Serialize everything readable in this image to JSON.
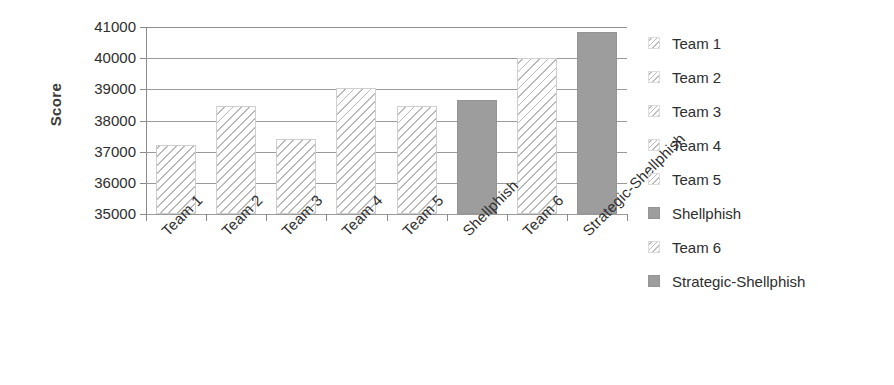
{
  "chart_data": {
    "type": "bar",
    "title": "",
    "xlabel": "",
    "ylabel": "Score",
    "ylim": [
      35000,
      41000
    ],
    "ytick_step": 1000,
    "yticks": [
      41000,
      40000,
      39000,
      38000,
      37000,
      36000,
      35000
    ],
    "ytick_labels": [
      "41000",
      "40000",
      "39000",
      "38000",
      "37000",
      "36000",
      "35000"
    ],
    "grid": true,
    "legend_position": "right",
    "categories": [
      "Team 1",
      "Team 2",
      "Team 3",
      "Team 4",
      "Team 5",
      "Shellphish",
      "Team 6",
      "Strategic-Shellphish"
    ],
    "values": [
      37200,
      38450,
      37400,
      39050,
      38450,
      38650,
      40000,
      40850
    ],
    "bars": [
      {
        "label": "Team 1",
        "value": 37200,
        "style": "hatch"
      },
      {
        "label": "Team 2",
        "value": 38450,
        "style": "hatch"
      },
      {
        "label": "Team 3",
        "value": 37400,
        "style": "hatch"
      },
      {
        "label": "Team 4",
        "value": 39050,
        "style": "hatch"
      },
      {
        "label": "Team 5",
        "value": 38450,
        "style": "hatch"
      },
      {
        "label": "Shellphish",
        "value": 38650,
        "style": "solid"
      },
      {
        "label": "Team 6",
        "value": 40000,
        "style": "hatch"
      },
      {
        "label": "Strategic-Shellphish",
        "value": 40850,
        "style": "solid"
      }
    ],
    "legend": [
      {
        "label": "Team 1",
        "style": "hatch"
      },
      {
        "label": "Team 2",
        "style": "hatch"
      },
      {
        "label": "Team 3",
        "style": "hatch"
      },
      {
        "label": "Team 4",
        "style": "hatch"
      },
      {
        "label": "Team 5",
        "style": "hatch"
      },
      {
        "label": "Shellphish",
        "style": "solid"
      },
      {
        "label": "Team 6",
        "style": "hatch"
      },
      {
        "label": "Strategic-Shellphish",
        "style": "solid"
      }
    ],
    "colors": {
      "hatch_stroke": "#b9b9b9",
      "solid_fill": "#9d9d9d",
      "gridline": "#9a9a9a",
      "axis": "#8a8a8a",
      "text": "#2e2e2e",
      "background": "#ffffff"
    }
  }
}
